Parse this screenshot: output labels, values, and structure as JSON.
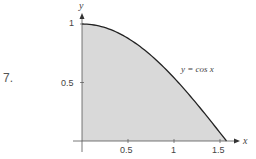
{
  "problem_number": "7.",
  "chart_data": {
    "type": "area",
    "title": "",
    "function": "y = cos x",
    "annotation": "y = cos x",
    "xlabel": "x",
    "ylabel": "y",
    "xlim": [
      0,
      1.5708
    ],
    "ylim": [
      0,
      1
    ],
    "x_ticks": [
      0.5,
      1,
      1.5
    ],
    "x_tick_labels": [
      "0.5",
      "1",
      "1.5"
    ],
    "y_ticks": [
      0.5,
      1
    ],
    "y_tick_labels": [
      "0.5",
      "1"
    ],
    "x": [
      0,
      0.25,
      0.5,
      0.75,
      1.0,
      1.25,
      1.5,
      1.5708
    ],
    "values": [
      1.0,
      0.969,
      0.878,
      0.732,
      0.54,
      0.315,
      0.071,
      0.0
    ],
    "fill_color": "#d9d9d9",
    "line_color": "#222222",
    "grid": false,
    "legend": "none"
  }
}
